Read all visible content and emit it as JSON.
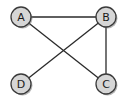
{
  "graph": {
    "nodes": [
      {
        "id": "A",
        "label": "A"
      },
      {
        "id": "B",
        "label": "B"
      },
      {
        "id": "C",
        "label": "C"
      },
      {
        "id": "D",
        "label": "D"
      }
    ],
    "edges": [
      {
        "from": "A",
        "to": "B"
      },
      {
        "from": "A",
        "to": "C"
      },
      {
        "from": "B",
        "to": "D"
      },
      {
        "from": "B",
        "to": "C"
      }
    ]
  }
}
